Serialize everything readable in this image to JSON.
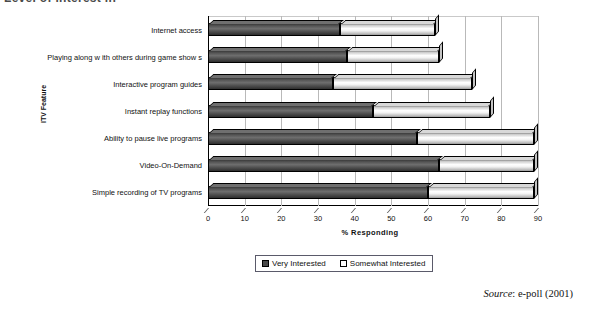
{
  "title_strip": "Level of interest in",
  "chart_data": {
    "type": "bar",
    "subtype": "stacked-horizontal-3d",
    "title": "",
    "xlabel": "% Responding",
    "ylabel": "ITV Feature",
    "xlim": [
      0,
      90
    ],
    "xticks": [
      0,
      10,
      20,
      30,
      40,
      50,
      60,
      70,
      80,
      90
    ],
    "grid": true,
    "legend_position": "bottom-center",
    "categories": [
      "Internet access",
      "Playing along w ith others during game show s",
      "Interactive program guides",
      "Instant replay functions",
      "Ability to pause live programs",
      "Video-On-Demand",
      "Simple recording of TV programs"
    ],
    "series": [
      {
        "name": "Very Interested",
        "color": "#4a4a4a",
        "values": [
          36,
          38,
          34,
          45,
          57,
          63,
          60
        ]
      },
      {
        "name": "Somewhat Interested",
        "color": "#fdfdfd",
        "values": [
          26,
          25,
          38,
          32,
          32,
          26,
          29
        ]
      }
    ],
    "totals": [
      62,
      63,
      72,
      77,
      89,
      89,
      89
    ]
  },
  "legend": {
    "items": [
      {
        "label": "Very Interested"
      },
      {
        "label": "Somewhat Interested"
      }
    ]
  },
  "source": {
    "prefix": "Source",
    "text": ": e-poll (2001)"
  }
}
